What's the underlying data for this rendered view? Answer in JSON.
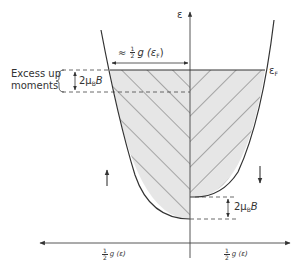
{
  "figure": {
    "axes": {
      "energy_axis_label": "ε",
      "left_axis_label": {
        "fraction": {
          "num": "1",
          "den": "2"
        },
        "text": "g (ε)"
      },
      "right_axis_label": {
        "fraction": {
          "num": "1",
          "den": "2"
        },
        "text": "g (ε)"
      }
    },
    "fermi_level_label": "ε",
    "fermi_level_sub": "F",
    "width_annotation": {
      "prefix": "≈",
      "fraction": {
        "num": "1",
        "den": "2"
      },
      "text": "g (ε",
      "sub": "F",
      "suffix": ")"
    },
    "excess_label": {
      "line1": "Excess up",
      "line2": "moments"
    },
    "splitting_label_top": {
      "text": "2μ",
      "sub": "B",
      "suffix": "B"
    },
    "splitting_label_bottom": {
      "text": "2μ",
      "sub": "B",
      "suffix": "B"
    },
    "spin_up_symbol": "↑",
    "spin_down_symbol": "↓",
    "colors": {
      "line": "#333333",
      "fill": "#e4e4e4",
      "hatch": "#555555",
      "background": "#ffffff"
    }
  }
}
